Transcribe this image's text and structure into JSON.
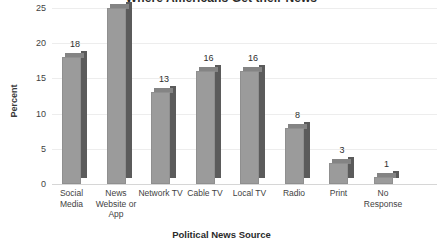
{
  "chart_data": {
    "type": "bar",
    "title": "Where Americans Get their News",
    "xlabel": "Political News Source",
    "ylabel": "Percent",
    "categories": [
      "Social Media",
      "News Website or App",
      "Network TV",
      "Cable TV",
      "Local TV",
      "Radio",
      "Print",
      "No Response"
    ],
    "values": [
      18,
      25,
      13,
      16,
      16,
      8,
      3,
      1
    ],
    "value_labels": [
      "18",
      "25",
      "13",
      "16",
      "16",
      "8",
      "3",
      "1"
    ],
    "ylim": [
      0,
      25
    ],
    "y_ticks": [
      0,
      5,
      10,
      15,
      20,
      25
    ],
    "y_tick_labels": [
      "0",
      "5",
      "10",
      "15",
      "20",
      "25"
    ],
    "grid": true,
    "legend": "none",
    "series_color_front": "#9b9b9b",
    "series_color_side": "#5b5b5b",
    "series_color_top": "#848484"
  }
}
